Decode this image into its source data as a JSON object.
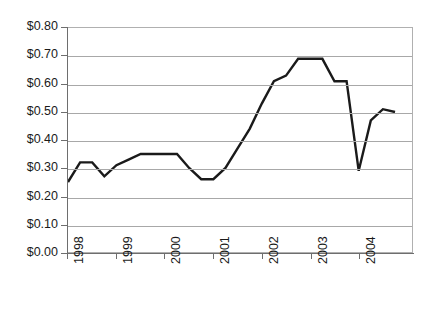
{
  "chart_data": {
    "type": "line",
    "title": "",
    "xlabel": "",
    "ylabel": "",
    "ylim": [
      0.0,
      0.8
    ],
    "grid": true,
    "legend": "none",
    "y_ticks": [
      "$0.00",
      "$0.10",
      "$0.20",
      "$0.30",
      "$0.40",
      "$0.50",
      "$0.60",
      "$0.70",
      "$0.80"
    ],
    "y_tick_values": [
      0.0,
      0.1,
      0.2,
      0.3,
      0.4,
      0.5,
      0.6,
      0.7,
      0.8
    ],
    "x_ticks": [
      "1998",
      "1999",
      "2000",
      "2001",
      "2002",
      "2003",
      "2004"
    ],
    "x_tick_values": [
      1998,
      1999,
      2000,
      2001,
      2002,
      2003,
      2004
    ],
    "x": [
      1998.0,
      1998.25,
      1998.5,
      1998.75,
      1999.0,
      1999.25,
      1999.5,
      1999.75,
      2000.0,
      2000.25,
      2000.5,
      2000.75,
      2001.0,
      2001.25,
      2001.5,
      2001.75,
      2002.0,
      2002.25,
      2002.5,
      2002.75,
      2003.0,
      2003.25,
      2003.5,
      2003.75,
      2004.0,
      2004.25,
      2004.5,
      2004.75
    ],
    "values": [
      0.25,
      0.32,
      0.32,
      0.27,
      0.31,
      0.33,
      0.35,
      0.35,
      0.35,
      0.35,
      0.3,
      0.26,
      0.26,
      0.3,
      0.37,
      0.44,
      0.53,
      0.61,
      0.63,
      0.69,
      0.69,
      0.69,
      0.61,
      0.61,
      0.29,
      0.47,
      0.51,
      0.5
    ],
    "series": [
      {
        "name": "Price",
        "color": "#1a1a1a",
        "line_width": 2.4,
        "values": [
          0.25,
          0.32,
          0.32,
          0.27,
          0.31,
          0.33,
          0.35,
          0.35,
          0.35,
          0.35,
          0.3,
          0.26,
          0.26,
          0.3,
          0.37,
          0.44,
          0.53,
          0.61,
          0.63,
          0.69,
          0.69,
          0.69,
          0.61,
          0.61,
          0.29,
          0.47,
          0.51,
          0.5
        ]
      }
    ],
    "colors": {
      "line": "#1a1a1a",
      "grid": "#a8a8a8",
      "axis": "#6e6e6e",
      "plot_border": "#b0b0b0",
      "background": "#ffffff",
      "text": "#1a1a1a"
    }
  }
}
